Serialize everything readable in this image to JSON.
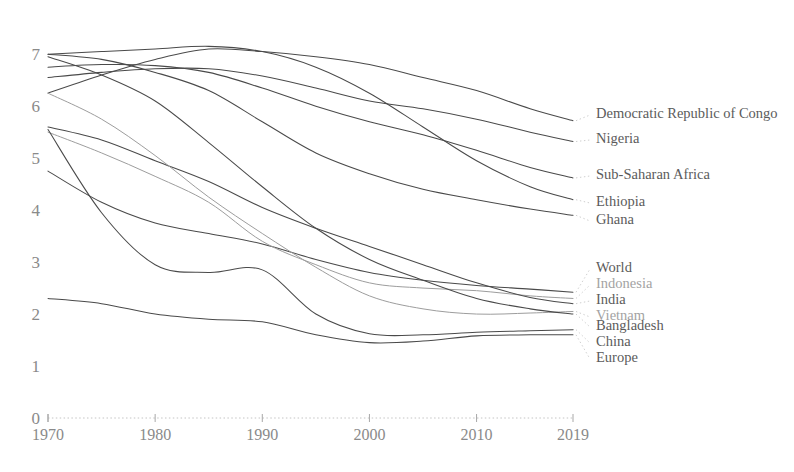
{
  "chart_data": {
    "type": "line",
    "title": "",
    "subtitle": "",
    "xlabel": "",
    "ylabel": "",
    "xlim": [
      1970,
      2019
    ],
    "ylim": [
      0,
      7.35
    ],
    "grid": false,
    "legend_position": "right-inline-labels",
    "y_ticks": [
      "0",
      "1",
      "2",
      "3",
      "4",
      "5",
      "6",
      "7"
    ],
    "y_tick_values": [
      0,
      1,
      2,
      3,
      4,
      5,
      6,
      7
    ],
    "x_ticks": [
      "1970",
      "1980",
      "1990",
      "2000",
      "2010",
      "2019"
    ],
    "x_tick_values": [
      1970,
      1980,
      1990,
      2000,
      2010,
      2019
    ],
    "x": [
      1970,
      1975,
      1980,
      1985,
      1990,
      1995,
      2000,
      2005,
      2010,
      2015,
      2019
    ],
    "series": [
      {
        "name": "Democratic Republic of Congo",
        "label": "Democratic Republic of Congo",
        "color": "#4a4a4a",
        "dim": false,
        "values": [
          6.25,
          6.6,
          6.9,
          7.1,
          7.05,
          6.95,
          6.8,
          6.55,
          6.3,
          5.95,
          5.72
        ],
        "label_y_value": 5.72
      },
      {
        "name": "Nigeria",
        "label": "Nigeria",
        "color": "#4a4a4a",
        "dim": false,
        "values": [
          6.55,
          6.65,
          6.72,
          6.72,
          6.58,
          6.35,
          6.1,
          5.95,
          5.75,
          5.5,
          5.32
        ],
        "label_y_value": 5.32
      },
      {
        "name": "Sub-Saharan Africa",
        "label": "Sub-Saharan Africa",
        "color": "#4a4a4a",
        "dim": false,
        "values": [
          6.75,
          6.8,
          6.78,
          6.65,
          6.35,
          6.0,
          5.7,
          5.45,
          5.15,
          4.82,
          4.62
        ],
        "label_y_value": 4.62
      },
      {
        "name": "Ethiopia",
        "label": "Ethiopia",
        "color": "#4a4a4a",
        "dim": false,
        "values": [
          7.0,
          7.05,
          7.1,
          7.15,
          7.05,
          6.75,
          6.25,
          5.6,
          4.95,
          4.45,
          4.2
        ],
        "label_y_value": 4.2
      },
      {
        "name": "Ghana",
        "label": "Ghana",
        "color": "#4a4a4a",
        "dim": false,
        "values": [
          7.0,
          6.9,
          6.65,
          6.3,
          5.7,
          5.1,
          4.7,
          4.4,
          4.2,
          4.02,
          3.9
        ],
        "label_y_value": 3.9
      },
      {
        "name": "World",
        "label": "World",
        "color": "#4a4a4a",
        "dim": false,
        "values": [
          4.75,
          4.15,
          3.75,
          3.55,
          3.35,
          3.05,
          2.8,
          2.65,
          2.55,
          2.48,
          2.42
        ],
        "label_y_value": 2.42
      },
      {
        "name": "Indonesia",
        "label": "Indonesia",
        "color": "#9d9d9d",
        "dim": true,
        "values": [
          5.5,
          5.1,
          4.65,
          4.15,
          3.4,
          2.95,
          2.6,
          2.5,
          2.45,
          2.35,
          2.3
        ],
        "label_y_value": 2.3
      },
      {
        "name": "India",
        "label": "India",
        "color": "#4a4a4a",
        "dim": false,
        "values": [
          5.6,
          5.35,
          4.95,
          4.55,
          4.05,
          3.65,
          3.3,
          2.95,
          2.6,
          2.32,
          2.2
        ],
        "label_y_value": 2.2
      },
      {
        "name": "Vietnam",
        "label": "Vietnam",
        "color": "#9d9d9d",
        "dim": true,
        "values": [
          6.25,
          5.75,
          5.05,
          4.25,
          3.55,
          2.9,
          2.35,
          2.1,
          2.0,
          2.02,
          2.05
        ],
        "label_y_value": 2.05
      },
      {
        "name": "Bangladesh",
        "label": "Bangladesh",
        "color": "#4a4a4a",
        "dim": false,
        "values": [
          6.95,
          6.6,
          6.1,
          5.3,
          4.45,
          3.65,
          3.05,
          2.65,
          2.3,
          2.1,
          2.0
        ],
        "label_y_value": 2.0
      },
      {
        "name": "China",
        "label": "China",
        "color": "#4a4a4a",
        "dim": false,
        "values": [
          5.55,
          3.95,
          2.95,
          2.8,
          2.85,
          2.0,
          1.62,
          1.6,
          1.65,
          1.68,
          1.7
        ],
        "label_y_value": 1.7
      },
      {
        "name": "Europe",
        "label": "Europe",
        "color": "#4a4a4a",
        "dim": false,
        "values": [
          2.3,
          2.2,
          2.0,
          1.9,
          1.85,
          1.6,
          1.45,
          1.48,
          1.58,
          1.6,
          1.6
        ],
        "label_y_value": 1.6
      }
    ]
  },
  "labels": {
    "democratic_republic_of_congo": "Democratic Republic of Congo",
    "nigeria": "Nigeria",
    "sub_saharan_africa": "Sub-Saharan Africa",
    "ethiopia": "Ethiopia",
    "ghana": "Ghana",
    "world": "World",
    "indonesia": "Indonesia",
    "india": "India",
    "vietnam": "Vietnam",
    "bangladesh": "Bangladesh",
    "china": "China",
    "europe": "Europe"
  },
  "colors": {
    "line": "#4a4a4a",
    "line_dim": "#9d9d9d",
    "tick_text": "#8a8a8a",
    "label_text": "#5b5b5b",
    "label_text_dim": "#a3a3a3",
    "axis": "#c4c4c4",
    "background": "#ffffff"
  }
}
